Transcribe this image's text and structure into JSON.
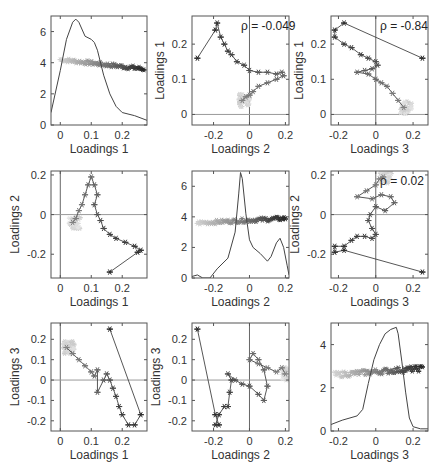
{
  "page_header": {
    "left": "",
    "right": ""
  },
  "chart_data": [
    {
      "panel": "1,1",
      "type": "line",
      "title": "",
      "xlabel": "Loadings 1",
      "ylabel": "",
      "xlim": [
        -0.03,
        0.28
      ],
      "ylim": [
        0,
        7
      ],
      "xticks": [
        "0",
        "0.1",
        "0.2"
      ],
      "yticks": [
        "0",
        "2",
        "4",
        "6"
      ],
      "density_curve": {
        "x": [
          -0.03,
          0.0,
          0.02,
          0.04,
          0.05,
          0.06,
          0.08,
          0.1,
          0.11,
          0.12,
          0.14,
          0.16,
          0.18,
          0.2,
          0.24,
          0.28
        ],
        "y": [
          0.8,
          3.5,
          5.5,
          6.6,
          6.8,
          6.6,
          5.7,
          5.5,
          5.3,
          4.8,
          3.2,
          2.0,
          1.2,
          0.8,
          0.6,
          0.3
        ]
      },
      "points_overlay": {
        "x_range": [
          0.0,
          0.27
        ],
        "y_level_start": 4.2,
        "y_level_end": 3.6,
        "marker": "*"
      },
      "rho_label": ""
    },
    {
      "panel": "1,2",
      "type": "scatter",
      "xlabel": "Loadings 2",
      "ylabel": "Loadings 1",
      "xlim": [
        -0.32,
        0.22
      ],
      "ylim": [
        -0.03,
        0.28
      ],
      "xticks": [
        "-0.2",
        "0",
        "0.2"
      ],
      "yticks": [
        "0",
        "0.1",
        "0.2"
      ],
      "rho_label": "ρ = -0.049",
      "path": {
        "x": [
          -0.29,
          -0.19,
          -0.18,
          -0.16,
          -0.14,
          -0.12,
          -0.1,
          -0.07,
          -0.03,
          0.0,
          0.05,
          0.1,
          0.15,
          0.18,
          0.19,
          0.15,
          0.1,
          0.05,
          0.02,
          0.0,
          -0.02,
          -0.04
        ],
        "y": [
          0.16,
          0.24,
          0.26,
          0.22,
          0.2,
          0.18,
          0.17,
          0.15,
          0.14,
          0.125,
          0.12,
          0.12,
          0.115,
          0.12,
          0.11,
          0.1,
          0.09,
          0.08,
          0.065,
          0.055,
          0.05,
          0.04
        ]
      }
    },
    {
      "panel": "1,3",
      "type": "scatter",
      "xlabel": "Loadings 3",
      "ylabel": "Loadings 1",
      "xlim": [
        -0.24,
        0.28
      ],
      "ylim": [
        -0.03,
        0.28
      ],
      "xticks": [
        "-0.2",
        "0",
        "0.2"
      ],
      "yticks": [
        "0",
        "0.1",
        "0.2"
      ],
      "rho_label": "ρ = -0.84",
      "path": {
        "x": [
          0.25,
          -0.17,
          -0.22,
          -0.22,
          -0.17,
          -0.13,
          -0.08,
          -0.04,
          0.0,
          0.01,
          -0.02,
          -0.06,
          -0.1,
          -0.04,
          0.0,
          0.03,
          0.06,
          0.09,
          0.12,
          0.15
        ],
        "y": [
          0.16,
          0.26,
          0.24,
          0.22,
          0.2,
          0.19,
          0.17,
          0.16,
          0.15,
          0.14,
          0.13,
          0.125,
          0.12,
          0.115,
          0.1,
          0.09,
          0.08,
          0.06,
          0.04,
          0.02
        ]
      }
    },
    {
      "panel": "2,1",
      "type": "scatter",
      "xlabel": "Loadings 1",
      "ylabel": "Loadings 2",
      "xlim": [
        -0.03,
        0.28
      ],
      "ylim": [
        -0.32,
        0.22
      ],
      "xticks": [
        "0",
        "0.1",
        "0.2"
      ],
      "yticks": [
        "-0.2",
        "0",
        "0.2"
      ],
      "rho_label": "",
      "path": {
        "x": [
          0.16,
          0.25,
          0.26,
          0.24,
          0.21,
          0.18,
          0.16,
          0.14,
          0.13,
          0.12,
          0.11,
          0.12,
          0.11,
          0.1,
          0.09,
          0.08,
          0.07,
          0.06,
          0.05,
          0.04
        ],
        "y": [
          -0.29,
          -0.19,
          -0.18,
          -0.16,
          -0.14,
          -0.12,
          -0.1,
          -0.07,
          -0.03,
          0.0,
          0.05,
          0.1,
          0.15,
          0.19,
          0.15,
          0.1,
          0.05,
          0.02,
          -0.02,
          -0.04
        ]
      }
    },
    {
      "panel": "2,2",
      "type": "line",
      "xlabel": "Loadings 2",
      "ylabel": "",
      "xlim": [
        -0.32,
        0.22
      ],
      "ylim": [
        0,
        7
      ],
      "xticks": [
        "-0.2",
        "0",
        "0.2"
      ],
      "yticks": [
        "0",
        "2",
        "4",
        "6"
      ],
      "density_curve": {
        "x": [
          -0.32,
          -0.29,
          -0.26,
          -0.22,
          -0.18,
          -0.12,
          -0.08,
          -0.06,
          -0.05,
          -0.04,
          -0.02,
          0.0,
          0.02,
          0.06,
          0.1,
          0.12,
          0.15,
          0.17,
          0.19,
          0.21,
          0.22
        ],
        "y": [
          0.1,
          0.2,
          0.0,
          0.0,
          0.6,
          1.3,
          3.0,
          5.5,
          6.9,
          6.5,
          4.2,
          2.5,
          2.0,
          1.6,
          1.1,
          1.4,
          2.3,
          2.6,
          2.0,
          0.8,
          0.2
        ]
      },
      "points_overlay": {
        "x_range": [
          -0.29,
          0.2
        ],
        "y_level_start": 3.6,
        "y_level_end": 3.9,
        "marker": "*"
      },
      "rho_label": ""
    },
    {
      "panel": "2,3",
      "type": "scatter",
      "xlabel": "Loadings 3",
      "ylabel": "Loadings 2",
      "xlim": [
        -0.24,
        0.28
      ],
      "ylim": [
        -0.32,
        0.22
      ],
      "xticks": [
        "-0.2",
        "0",
        "0.2"
      ],
      "yticks": [
        "-0.2",
        "0",
        "0.2"
      ],
      "rho_label": "ρ = 0.02",
      "path": {
        "x": [
          0.25,
          -0.17,
          -0.22,
          -0.22,
          -0.17,
          -0.13,
          -0.1,
          -0.06,
          -0.02,
          0.0,
          -0.02,
          -0.04,
          -0.03,
          0.0,
          0.05,
          0.1,
          0.08,
          0.03,
          -0.02,
          -0.1,
          -0.05,
          0.0,
          0.02,
          0.04
        ],
        "y": [
          -0.29,
          -0.18,
          -0.19,
          -0.16,
          -0.16,
          -0.13,
          -0.11,
          -0.11,
          -0.12,
          -0.1,
          -0.07,
          -0.03,
          0.0,
          0.04,
          0.02,
          0.06,
          0.09,
          0.1,
          0.08,
          0.09,
          0.12,
          0.15,
          0.18,
          0.19
        ]
      }
    },
    {
      "panel": "3,1",
      "type": "scatter",
      "xlabel": "Loadings 1",
      "ylabel": "Loadings 3",
      "xlim": [
        -0.03,
        0.28
      ],
      "ylim": [
        -0.25,
        0.28
      ],
      "xticks": [
        "0",
        "0.1",
        "0.2"
      ],
      "yticks": [
        "-0.2",
        "-0.1",
        "0",
        "0.1",
        "0.2"
      ],
      "rho_label": "",
      "path": {
        "x": [
          0.16,
          0.26,
          0.24,
          0.22,
          0.2,
          0.19,
          0.18,
          0.17,
          0.16,
          0.15,
          0.14,
          0.12,
          0.12,
          0.11,
          0.1,
          0.08,
          0.06,
          0.04,
          0.02
        ],
        "y": [
          0.25,
          -0.17,
          -0.22,
          -0.22,
          -0.17,
          -0.13,
          -0.08,
          -0.04,
          0.0,
          0.03,
          0.0,
          -0.06,
          0.05,
          0.02,
          0.04,
          0.07,
          0.1,
          0.13,
          0.16
        ]
      }
    },
    {
      "panel": "3,2",
      "type": "scatter",
      "xlabel": "Loadings 2",
      "ylabel": "Loadings 3",
      "xlim": [
        -0.32,
        0.22
      ],
      "ylim": [
        -0.25,
        0.28
      ],
      "xticks": [
        "-0.2",
        "0",
        "0.2"
      ],
      "yticks": [
        "-0.2",
        "-0.1",
        "0",
        "0.1",
        "0.2"
      ],
      "rho_label": "",
      "path": {
        "x": [
          -0.29,
          -0.19,
          -0.17,
          -0.19,
          -0.17,
          -0.14,
          -0.12,
          -0.11,
          -0.1,
          -0.12,
          -0.08,
          -0.04,
          0.0,
          0.05,
          0.08,
          0.1,
          0.08,
          0.05,
          0.02,
          0.0,
          0.05,
          0.1,
          0.15,
          0.18,
          0.2
        ],
        "y": [
          0.25,
          -0.17,
          -0.22,
          -0.22,
          -0.17,
          -0.13,
          -0.13,
          -0.06,
          0.0,
          0.03,
          0.0,
          -0.02,
          -0.03,
          -0.07,
          -0.1,
          -0.03,
          0.05,
          0.1,
          0.13,
          0.1,
          0.08,
          0.06,
          0.04,
          0.06,
          0.03
        ]
      }
    },
    {
      "panel": "3,3",
      "type": "line",
      "xlabel": "Loadings 3",
      "ylabel": "",
      "xlim": [
        -0.24,
        0.28
      ],
      "ylim": [
        0,
        5
      ],
      "xticks": [
        "-0.2",
        "0",
        "0.2"
      ],
      "yticks": [
        "0",
        "2",
        "4"
      ],
      "density_curve": {
        "x": [
          -0.24,
          -0.18,
          -0.1,
          -0.07,
          -0.04,
          -0.01,
          0.02,
          0.05,
          0.08,
          0.11,
          0.12,
          0.14,
          0.16,
          0.18,
          0.2,
          0.24,
          0.28
        ],
        "y": [
          0.3,
          0.5,
          0.7,
          1.0,
          2.2,
          3.3,
          4.0,
          4.5,
          4.7,
          4.8,
          4.5,
          3.2,
          1.8,
          0.6,
          0.2,
          0.1,
          0.1
        ]
      },
      "points_overlay": {
        "x_range": [
          -0.22,
          0.25
        ],
        "y_level_start": 2.6,
        "y_level_end": 2.9,
        "marker": "*"
      },
      "rho_label": ""
    }
  ],
  "layout": {
    "cols_x": [
      [
        51,
        147
      ],
      [
        192,
        289
      ],
      [
        331,
        428
      ]
    ],
    "rows_y": [
      [
        16,
        125
      ],
      [
        171,
        278
      ],
      [
        323,
        431
      ]
    ]
  }
}
